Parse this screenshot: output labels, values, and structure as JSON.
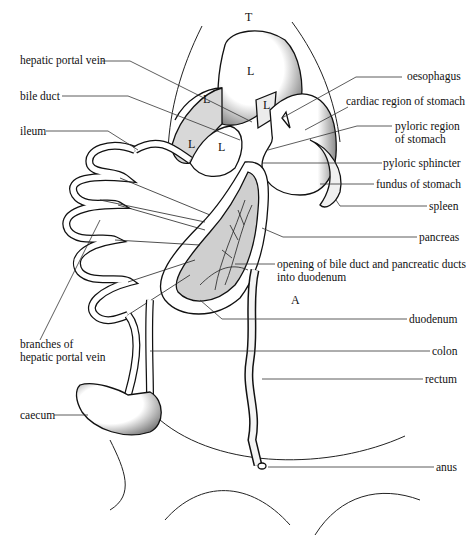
{
  "diagram": {
    "type": "anatomical-illustration",
    "region_letters": [
      {
        "text": "T",
        "x": 245,
        "y": 18
      },
      {
        "text": "L",
        "x": 247,
        "y": 72
      },
      {
        "text": "L",
        "x": 203,
        "y": 100
      },
      {
        "text": "L",
        "x": 263,
        "y": 106
      },
      {
        "text": "L",
        "x": 188,
        "y": 145
      },
      {
        "text": "L",
        "x": 218,
        "y": 148
      },
      {
        "text": "A",
        "x": 291,
        "y": 301
      }
    ],
    "labels_left": [
      {
        "id": "hepatic-portal-vein",
        "text": "hepatic portal vein",
        "x": 20,
        "y": 54
      },
      {
        "id": "bile-duct",
        "text": "bile duct",
        "x": 20,
        "y": 90
      },
      {
        "id": "ileum",
        "text": "ileum",
        "x": 20,
        "y": 125
      },
      {
        "id": "branches-of-hepatic-portal-vein",
        "text": "branches of\nhepatic portal vein",
        "x": 20,
        "y": 338
      },
      {
        "id": "caecum",
        "text": "caecum",
        "x": 20,
        "y": 409
      }
    ],
    "labels_right": [
      {
        "id": "oesophagus",
        "text": "oesophagus",
        "x": 407,
        "y": 70
      },
      {
        "id": "cardiac-region-of-stomach",
        "text": "cardiac region of stomach",
        "x": 346,
        "y": 95
      },
      {
        "id": "pyloric-region-of-stomach",
        "text": "pyloric region\nof stomach",
        "x": 395,
        "y": 120
      },
      {
        "id": "pyloric-sphincter",
        "text": "pyloric sphincter",
        "x": 383,
        "y": 157
      },
      {
        "id": "fundus-of-stomach",
        "text": "fundus of stomach",
        "x": 376,
        "y": 178
      },
      {
        "id": "spleen",
        "text": "spleen",
        "x": 429,
        "y": 200
      },
      {
        "id": "pancreas",
        "text": "pancreas",
        "x": 419,
        "y": 231
      },
      {
        "id": "opening-of-ducts",
        "text": "opening of bile duct and pancreatic ducts\ninto duodenum",
        "x": 277,
        "y": 258
      },
      {
        "id": "duodenum",
        "text": "duodenum",
        "x": 409,
        "y": 313
      },
      {
        "id": "colon",
        "text": "colon",
        "x": 432,
        "y": 345
      },
      {
        "id": "rectum",
        "text": "rectum",
        "x": 425,
        "y": 373
      },
      {
        "id": "anus",
        "text": "anus",
        "x": 436,
        "y": 461
      }
    ]
  }
}
